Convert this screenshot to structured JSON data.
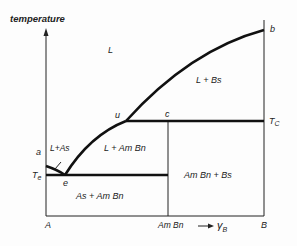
{
  "diagram": {
    "type": "binary phase diagram (compound-forming, eutectic + peritectic)",
    "axis": {
      "y_label": "temperature",
      "x_label": "γ",
      "x_label_subscript": "B",
      "x_ticks": [
        "A",
        "Am Bn",
        "B"
      ]
    },
    "temperature_labels": {
      "eutectic": "T",
      "eutectic_sub": "e",
      "peritectic": "T",
      "peritectic_sub": "C"
    },
    "points": {
      "a": "a",
      "b": "b",
      "c": "c",
      "e": "e",
      "u": "u"
    },
    "regions": {
      "liquid": "L",
      "l_bs": "L + Bs",
      "l_as": "L+As",
      "l_ambn": "L + Am Bn",
      "as_ambn": "As + Am Bn",
      "ambn_bs": "Am Bn + Bs"
    },
    "colors": {
      "line": "#111111",
      "background": "#fdfdfd"
    }
  }
}
